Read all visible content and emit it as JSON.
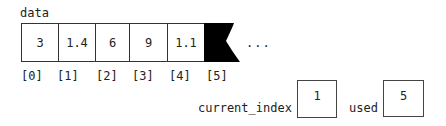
{
  "array": {
    "name": "data",
    "cells": [
      "3",
      "1.4",
      "6",
      "9",
      "1.1"
    ],
    "indices": [
      "[0]",
      "[1]",
      "[2]",
      "[3]",
      "[4]",
      "[5]"
    ],
    "ellipsis": "..."
  },
  "variables": {
    "current_index": {
      "label": "current_index",
      "value": "1"
    },
    "used": {
      "label": "used",
      "value": "5"
    }
  }
}
